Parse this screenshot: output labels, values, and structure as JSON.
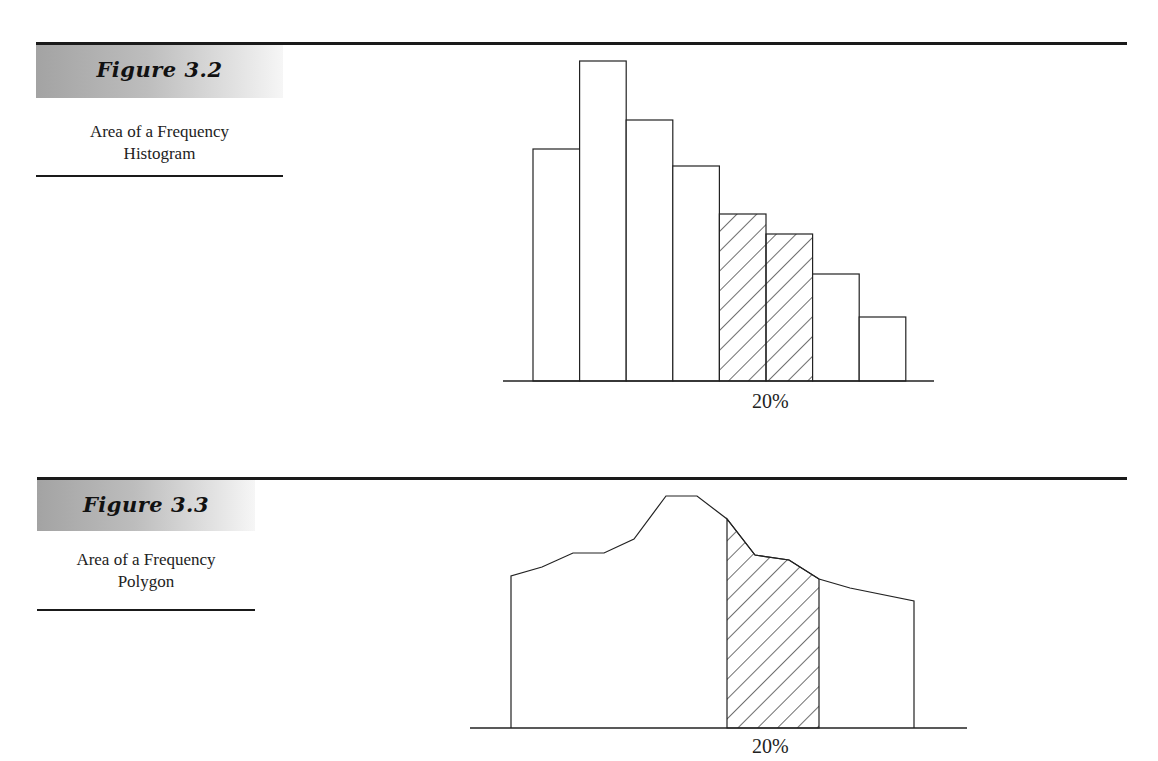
{
  "figures": [
    {
      "title": "Figure 3.2",
      "caption_line1": "Area of a Frequency",
      "caption_line2": "Histogram",
      "shaded_label": "20%"
    },
    {
      "title": "Figure 3.3",
      "caption_line1": "Area of a Frequency",
      "caption_line2": "Polygon",
      "shaded_label": "20%"
    }
  ],
  "chart_data": [
    {
      "type": "bar",
      "title": "Figure 3.2 — Area of a Frequency Histogram",
      "xlabel": "",
      "ylabel": "",
      "categories": [
        "1",
        "2",
        "3",
        "4",
        "5",
        "6",
        "7",
        "8"
      ],
      "values": [
        232,
        320,
        261,
        215,
        167,
        147,
        107,
        64
      ],
      "shaded_bars": [
        5,
        6
      ],
      "annotation": "20%",
      "grid": false,
      "axes": "baseline only"
    },
    {
      "type": "area",
      "title": "Figure 3.3 — Area of a Frequency Polygon",
      "xlabel": "",
      "ylabel": "",
      "x": [
        511,
        542,
        573,
        604,
        634,
        666,
        697,
        727,
        755,
        789,
        819,
        850,
        914
      ],
      "y": [
        152,
        161,
        175,
        175,
        189,
        232,
        232,
        209,
        173,
        168,
        149,
        140,
        127
      ],
      "shaded_range": [
        727,
        819
      ],
      "annotation": "20%",
      "grid": false,
      "axes": "baseline only"
    }
  ]
}
